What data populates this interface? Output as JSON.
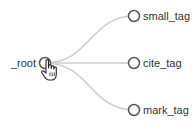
{
  "tree": {
    "root": {
      "label": "_root",
      "cx": 45,
      "cy": 63
    },
    "children": [
      {
        "label": "small_tag",
        "cx": 134,
        "cy": 16
      },
      {
        "label": "cite_tag",
        "cx": 134,
        "cy": 63
      },
      {
        "label": "mark_tag",
        "cx": 134,
        "cy": 110
      }
    ]
  },
  "colors": {
    "link": "#cccccc",
    "node_stroke": "#555555",
    "node_fill": "#ffffff",
    "text": "#333333"
  },
  "cursor": {
    "type": "hand-pointer",
    "x": 46,
    "y": 62
  }
}
